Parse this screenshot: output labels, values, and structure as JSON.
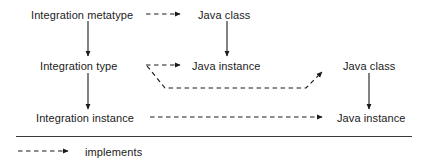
{
  "diagram": {
    "stroke_color": "#1b1b1b",
    "background_color": "#ffffff",
    "nodes": [
      {
        "id": "integration-metatype",
        "label": "Integration metatype",
        "x": 31,
        "y": 10,
        "column": "left",
        "row": "top"
      },
      {
        "id": "java-class-top",
        "label": "Java class",
        "x": 198,
        "y": 10,
        "column": "mid",
        "row": "top"
      },
      {
        "id": "integration-type",
        "label": "Integration type",
        "x": 40,
        "y": 61,
        "column": "left",
        "row": "middle"
      },
      {
        "id": "java-instance-mid",
        "label": "Java instance",
        "x": 192,
        "y": 61,
        "column": "mid",
        "row": "middle"
      },
      {
        "id": "java-class-right",
        "label": "Java class",
        "x": 343,
        "y": 61,
        "column": "right",
        "row": "middle"
      },
      {
        "id": "integration-instance",
        "label": "Integration instance",
        "x": 36,
        "y": 113,
        "column": "left",
        "row": "bottom"
      },
      {
        "id": "java-instance-right",
        "label": "Java instance",
        "x": 337,
        "y": 113,
        "column": "right",
        "row": "bottom"
      }
    ],
    "edges": [
      {
        "id": "metatype-to-type",
        "style": "solid",
        "from": "integration-metatype",
        "to": "integration-type"
      },
      {
        "id": "type-to-instance",
        "style": "solid",
        "from": "integration-type",
        "to": "integration-instance"
      },
      {
        "id": "java-class-to-java-instance",
        "style": "solid",
        "from": "java-class-top",
        "to": "java-instance-mid"
      },
      {
        "id": "java-class-right-to-instance",
        "style": "solid",
        "from": "java-class-right",
        "to": "java-instance-right"
      },
      {
        "id": "metatype-implements-class",
        "style": "dashed",
        "from": "integration-metatype",
        "to": "java-class-top"
      },
      {
        "id": "type-implements-instance",
        "style": "dashed",
        "from": "integration-type",
        "to": "java-instance-mid"
      },
      {
        "id": "type-implements-class-right",
        "style": "dashed",
        "from": "integration-type",
        "to": "java-class-right"
      },
      {
        "id": "instance-implements-instance",
        "style": "dashed",
        "from": "integration-instance",
        "to": "java-instance-right"
      }
    ]
  },
  "legend": {
    "separator": true,
    "items": [
      {
        "id": "implements",
        "label": "implements",
        "style": "dashed",
        "x": 85,
        "y": 147
      }
    ]
  }
}
